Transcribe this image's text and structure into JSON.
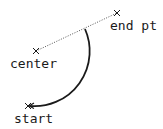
{
  "diagram": {
    "title": "",
    "points": {
      "end": {
        "label": "end pt",
        "x": 117,
        "y": 13
      },
      "center": {
        "label": "center",
        "x": 36,
        "y": 51
      },
      "start": {
        "label": "start",
        "x": 28,
        "y": 106
      }
    },
    "arc": {
      "from": "start",
      "to": "end-direction",
      "radius": 55,
      "direction": "counterclockwise",
      "arrowhead_at": "start"
    },
    "colors": {
      "stroke": "#1a1a1a",
      "dotted": "#555555",
      "background": "#ffffff"
    }
  }
}
